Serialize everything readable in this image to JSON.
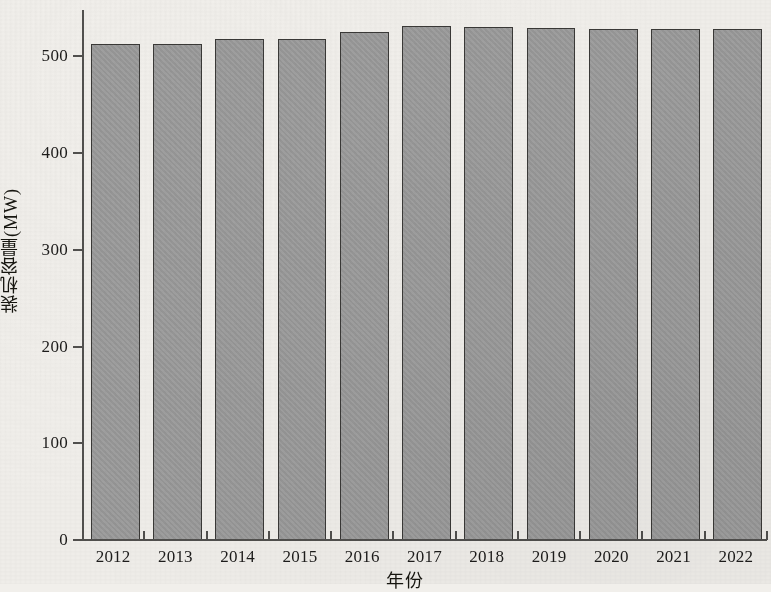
{
  "chart_data": {
    "type": "bar",
    "title": "",
    "xlabel": "年份",
    "ylabel": "装机容量(MW)",
    "categories": [
      "2012",
      "2013",
      "2014",
      "2015",
      "2016",
      "2017",
      "2018",
      "2019",
      "2020",
      "2021",
      "2022"
    ],
    "values": [
      513,
      513,
      518,
      518,
      525,
      531,
      530,
      529,
      528,
      528,
      528
    ],
    "ylim": [
      0,
      548
    ],
    "ytick_values": [
      0,
      100,
      200,
      300,
      400,
      500
    ],
    "ytick_labels": [
      "0",
      "100",
      "200",
      "300",
      "400",
      "500"
    ],
    "grid": false,
    "legend": null,
    "series": [
      {
        "name": "装机容量",
        "values": [
          513,
          513,
          518,
          518,
          525,
          531,
          530,
          529,
          528,
          528,
          528
        ]
      }
    ],
    "colors": {
      "bar_fill": "#9b9b9b",
      "bar_border": "#3a3937",
      "axis": "#51504e",
      "text": "#1d1c1b",
      "background": "#f1efeb"
    }
  }
}
